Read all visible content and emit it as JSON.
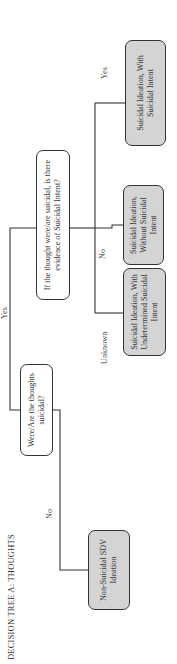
{
  "title": "DECISION TREE A: THOUGHTS",
  "nodes": {
    "q1": "Were/Are the thoughts suicidal?",
    "q2": "If the thought were/are suicidal, is there evidence of Suicidal Intent?",
    "non_suicidal": "Non-Suicidal SDV Ideation",
    "undetermined": "Suicidal Ideation, With Undetermined Suicidal Intent",
    "without": "Suicidal Ideation, Without Suicidal Intent",
    "with": "Suicidal Ideation, With Suicidal Intent"
  },
  "edges": {
    "q1_no": "No",
    "q1_yes": "Yes",
    "q2_unknown": "Unknown",
    "q2_no": "No",
    "q2_yes": "Yes"
  },
  "colors": {
    "question_fill": "#ffffff",
    "answer_fill": "#d4d4d4",
    "stroke": "#333333"
  }
}
